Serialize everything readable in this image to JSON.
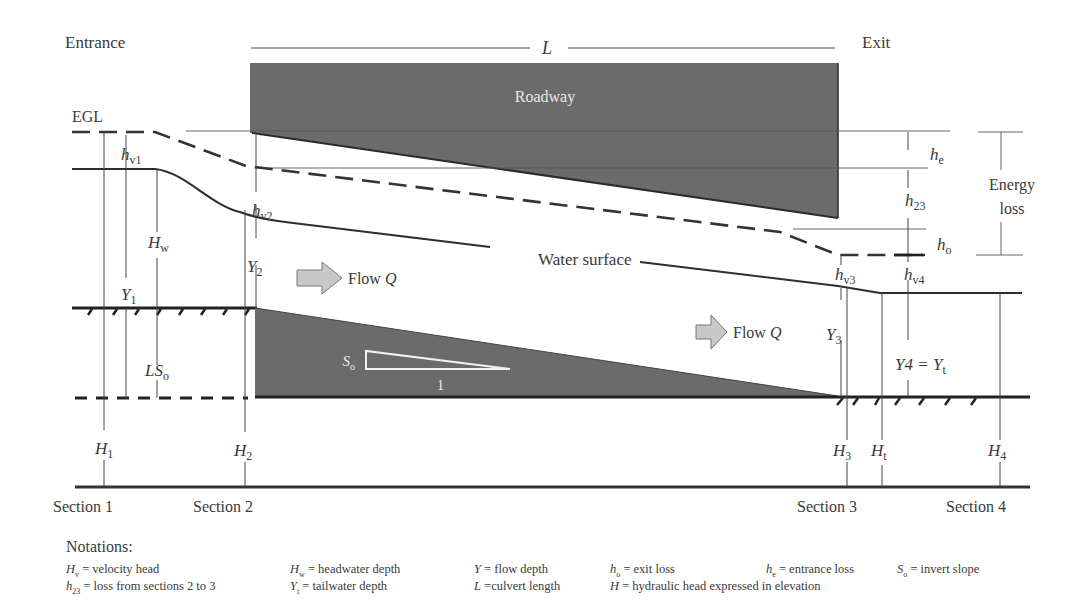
{
  "diagram": {
    "labels": {
      "entrance": "Entrance",
      "exit": "Exit",
      "length": "L",
      "roadway": "Roadway",
      "egl": "EGL",
      "water_surface": "Water surface",
      "flow_1": "Flow ",
      "flow_2": "Flow ",
      "flow_var": "Q",
      "energy_loss_1": "Energy",
      "energy_loss_2": "loss",
      "slope_symbol": "S",
      "slope_sub": "o",
      "slope_run": "1"
    },
    "symbols": {
      "hv1": {
        "main": "h",
        "sub": "v1"
      },
      "hv2": {
        "main": "h",
        "sub": "v2"
      },
      "hv3": {
        "main": "h",
        "sub": "v3"
      },
      "hv4": {
        "main": "h",
        "sub": "v4"
      },
      "he": {
        "main": "h",
        "sub": "e"
      },
      "h23": {
        "main": "h",
        "sub": "23"
      },
      "ho": {
        "main": "h",
        "sub": "o"
      },
      "Hw": {
        "main": "H",
        "sub": "w"
      },
      "Y1": {
        "main": "Y",
        "sub": "1"
      },
      "Y2": {
        "main": "Y",
        "sub": "2"
      },
      "Y3": {
        "main": "Y",
        "sub": "3"
      },
      "Y4": {
        "main": "Y4 = Y",
        "sub": "t"
      },
      "LSo": {
        "main": "LS",
        "sub": "o"
      },
      "H1": {
        "main": "H",
        "sub": "1"
      },
      "H2": {
        "main": "H",
        "sub": "2"
      },
      "H3": {
        "main": "H",
        "sub": "3"
      },
      "Ht": {
        "main": "H",
        "sub": "t"
      },
      "H4": {
        "main": "H",
        "sub": "4"
      }
    },
    "sections": [
      "Section 1",
      "Section 2",
      "Section 3",
      "Section 4"
    ],
    "colors": {
      "fill_dark": "#6b6b6b",
      "line": "#333333",
      "arrow_fill": "#c8c8c8"
    }
  },
  "notations": {
    "title": "Notations:",
    "row1": [
      {
        "sym": "H",
        "sub": "v",
        "text": " = velocity head"
      },
      {
        "sym": "H",
        "sub": "w",
        "text": " = headwater depth"
      },
      {
        "sym": "Y",
        "sub": "",
        "text": " = flow depth"
      },
      {
        "sym": "h",
        "sub": "o",
        "text": " = exit loss"
      },
      {
        "sym": "h",
        "sub": "e",
        "text": " = entrance loss"
      },
      {
        "sym": "S",
        "sub": "o",
        "text": " = invert slope"
      }
    ],
    "row2": [
      {
        "sym": "h",
        "sub": "23",
        "text": " = loss from sections 2 to 3"
      },
      {
        "sym": "Y",
        "sub": "t",
        "text": " = tailwater depth"
      },
      {
        "sym": "L",
        "sub": "",
        "text": " =culvert length"
      },
      {
        "sym": "H",
        "sub": "",
        "text": " = hydraulic head expressed in elevation"
      }
    ]
  }
}
